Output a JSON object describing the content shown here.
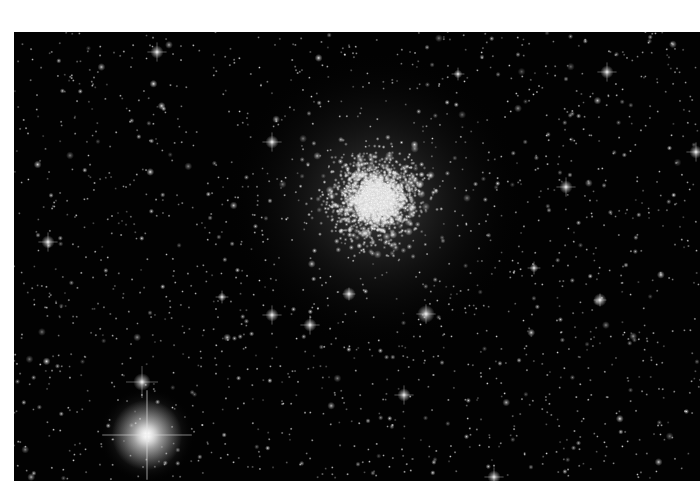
{
  "image": {
    "subject": "globular star cluster",
    "frame": {
      "x": 14,
      "y": 32,
      "width": 686,
      "height": 449
    },
    "background_color": "#020202",
    "page_background": "#ffffff"
  },
  "cluster": {
    "center_x": 362,
    "center_y": 168,
    "core_radius": 70,
    "halo_radius": 150,
    "star_count": 2600
  },
  "field": {
    "star_count": 1700,
    "seed": 7
  },
  "bright_stars": [
    {
      "x": 133,
      "y": 403,
      "r": 16,
      "spikes": 28
    },
    {
      "x": 128,
      "y": 350,
      "r": 4,
      "spikes": 10
    },
    {
      "x": 143,
      "y": 20,
      "r": 3,
      "spikes": 6
    },
    {
      "x": 258,
      "y": 110,
      "r": 3,
      "spikes": 6
    },
    {
      "x": 258,
      "y": 283,
      "r": 3,
      "spikes": 6
    },
    {
      "x": 296,
      "y": 293,
      "r": 3,
      "spikes": 6
    },
    {
      "x": 412,
      "y": 282,
      "r": 4,
      "spikes": 6
    },
    {
      "x": 335,
      "y": 262,
      "r": 3,
      "spikes": 4
    },
    {
      "x": 552,
      "y": 155,
      "r": 3,
      "spikes": 6
    },
    {
      "x": 34,
      "y": 210,
      "r": 3,
      "spikes": 6
    },
    {
      "x": 593,
      "y": 40,
      "r": 3,
      "spikes": 6
    },
    {
      "x": 586,
      "y": 268,
      "r": 3,
      "spikes": 4
    },
    {
      "x": 390,
      "y": 363,
      "r": 3,
      "spikes": 6
    },
    {
      "x": 480,
      "y": 445,
      "r": 3,
      "spikes": 6
    },
    {
      "x": 682,
      "y": 120,
      "r": 3,
      "spikes": 6
    },
    {
      "x": 444,
      "y": 42,
      "r": 2,
      "spikes": 4
    },
    {
      "x": 208,
      "y": 265,
      "r": 2,
      "spikes": 4
    },
    {
      "x": 520,
      "y": 236,
      "r": 2,
      "spikes": 4
    }
  ]
}
